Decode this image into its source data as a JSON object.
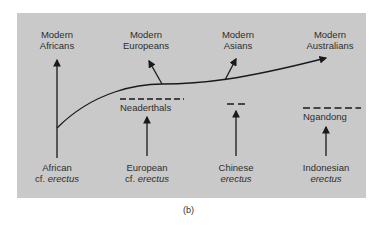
{
  "figure": {
    "caption": "(b)",
    "top_labels": [
      {
        "line1": "Modern",
        "line2": "Africans"
      },
      {
        "line1": "Modern",
        "line2": "Europeans"
      },
      {
        "line1": "Modern",
        "line2": "Asians"
      },
      {
        "line1": "Modern",
        "line2": "Australians"
      }
    ],
    "bottom_labels": [
      {
        "line1": "African",
        "prefix": "cf. ",
        "line2": "erectus"
      },
      {
        "line1": "European",
        "prefix": "cf. ",
        "line2": "erectus"
      },
      {
        "line1": "Chinese",
        "prefix": "",
        "line2": "erectus"
      },
      {
        "line1": "Indonesian",
        "prefix": "",
        "line2": "erectus"
      }
    ],
    "side_groups": [
      {
        "label": "Neaderthals"
      },
      {
        "label": ""
      },
      {
        "label": "Ngandong"
      }
    ],
    "colors": {
      "panel": "#c9c9c9",
      "ink": "#1a1a1a",
      "text": "#2e2e2e"
    }
  }
}
